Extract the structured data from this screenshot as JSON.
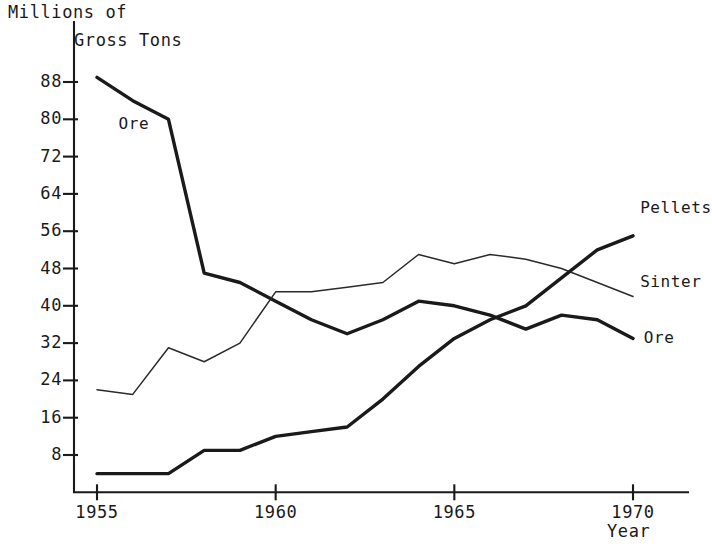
{
  "chart_data": {
    "type": "line",
    "title": "",
    "ylabel": "Millions of Gross Tons",
    "ylabel_line1": "Millions of",
    "ylabel_line2": "Gross Tons",
    "xlabel": "Year",
    "xlim": [
      1954.2,
      1971.0
    ],
    "ylim": [
      0,
      92
    ],
    "grid": false,
    "legend_position": "inline-end-labels",
    "x_ticks": [
      1955,
      1960,
      1965,
      1970
    ],
    "x_tick_labels": [
      "1955",
      "1960",
      "1965",
      "1970"
    ],
    "y_ticks": [
      8,
      16,
      24,
      32,
      40,
      48,
      56,
      64,
      72,
      80,
      88
    ],
    "y_tick_labels": [
      "8",
      "16",
      "24",
      "32",
      "40",
      "48",
      "56",
      "64",
      "72",
      "80",
      "88"
    ],
    "x": [
      1955,
      1956,
      1957,
      1958,
      1959,
      1960,
      1961,
      1962,
      1963,
      1964,
      1965,
      1966,
      1967,
      1968,
      1969,
      1970
    ],
    "series": [
      {
        "name": "Ore",
        "style": "thick",
        "label_positions": [
          "left",
          "right"
        ],
        "values": [
          89,
          84,
          80,
          47,
          45,
          41,
          37,
          34,
          37,
          41,
          40,
          38,
          35,
          38,
          37,
          33
        ]
      },
      {
        "name": "Sinter",
        "style": "thin",
        "label_positions": [
          "right"
        ],
        "values": [
          22,
          21,
          31,
          28,
          32,
          43,
          43,
          44,
          45,
          51,
          49,
          51,
          50,
          48,
          45,
          42
        ]
      },
      {
        "name": "Pellets",
        "style": "thick",
        "label_positions": [
          "right"
        ],
        "values": [
          4,
          4,
          4,
          9,
          9,
          12,
          13,
          14,
          20,
          27,
          33,
          37,
          40,
          46,
          52,
          55
        ]
      }
    ],
    "annotations": [
      {
        "text": "Ore",
        "x": 1955.6,
        "y": 79,
        "anchor": "start"
      },
      {
        "text": "Pellets",
        "x": 1970.2,
        "y": 61,
        "anchor": "start"
      },
      {
        "text": "Sinter",
        "x": 1970.2,
        "y": 45,
        "anchor": "start"
      },
      {
        "text": "Ore",
        "x": 1970.3,
        "y": 33,
        "anchor": "start"
      }
    ]
  }
}
